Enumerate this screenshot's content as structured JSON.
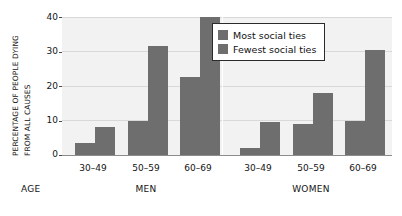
{
  "chart_data": {
    "type": "bar",
    "title": "",
    "subtitle": "",
    "xlabel": "AGE",
    "ylabel": "PERCENTAGE OF PEOPLE DYING FROM ALL CAUSES",
    "ylabel_lines": [
      "PERCENTAGE OF PEOPLE DYING",
      "FROM ALL CAUSES"
    ],
    "ylim": [
      0,
      40
    ],
    "yticks": [
      0,
      10,
      20,
      30,
      40
    ],
    "ytick_labels": [
      "0",
      "10",
      "20",
      "30",
      "40"
    ],
    "grid": true,
    "legend_position": "top-right-inside",
    "categories": [
      "30–49",
      "50–59",
      "60–69",
      "30–49",
      "50–59",
      "60–69"
    ],
    "groups": [
      {
        "name": "MEN",
        "categories": [
          "30–49",
          "50–59",
          "60–69"
        ]
      },
      {
        "name": "WOMEN",
        "categories": [
          "30–49",
          "50–59",
          "60–69"
        ]
      }
    ],
    "series": [
      {
        "name": "Most social ties",
        "color": "#6e6e6e",
        "values": [
          3.5,
          10,
          22.5,
          2,
          9,
          10
        ]
      },
      {
        "name": "Fewest social ties",
        "color": "#6e6e6e",
        "values": [
          8,
          31.5,
          40,
          9.5,
          18,
          30.5
        ]
      }
    ],
    "colors": {
      "plot_background": "#f2f2f2",
      "gridline": "#d8d8d8",
      "bar": "#6e6e6e",
      "axis": "#8c8c8c",
      "text": "#141414",
      "legend_border": "#2b2b2b",
      "page_background": "#ffffff"
    }
  },
  "legend": {
    "items": [
      {
        "label": "Most social ties",
        "color": "#6e6e6e"
      },
      {
        "label": "Fewest social ties",
        "color": "#6e6e6e"
      }
    ]
  },
  "axes": {
    "y_title_line1": "PERCENTAGE OF PEOPLE DYING",
    "y_title_line2": "FROM ALL CAUSES",
    "y_ticks": [
      "40",
      "30",
      "20",
      "10",
      "0"
    ],
    "x_axis_name": "AGE",
    "x_categories": [
      "30–49",
      "50–59",
      "60–69",
      "30–49",
      "50–59",
      "60–69"
    ],
    "x_groups": [
      "MEN",
      "WOMEN"
    ]
  }
}
